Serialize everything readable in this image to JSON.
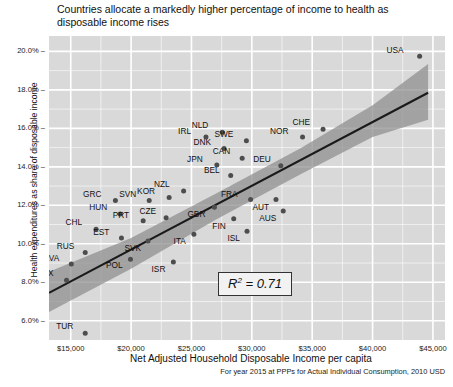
{
  "chart_data": {
    "type": "scatter",
    "title": "Countries allocate a markedly higher percentage of income to health as disposable income rises",
    "xlabel": "Net Adjusted Household Disposable Income per capita",
    "ylabel": "Health expenditures as share of disposable income",
    "note": "For year 2015 at PPPs for Actual Individual Consumption, 2010 USD",
    "annotation": "R² = 0.71",
    "annotation_r": "R",
    "annotation_sup": "2",
    "annotation_rest": " = 0.71",
    "xlim": [
      13200,
      46000
    ],
    "ylim": [
      5.0,
      20.8
    ],
    "xticks": [
      15000,
      20000,
      25000,
      30000,
      35000,
      40000,
      45000
    ],
    "xticklabels": [
      "$15,000",
      "$20,000",
      "$25,000",
      "$30,000",
      "$35,000",
      "$40,000",
      "$45,000"
    ],
    "yticks": [
      6,
      8,
      10,
      12,
      14,
      16,
      18,
      20
    ],
    "yticklabels": [
      "6.0%",
      "8.0%",
      "10.0%",
      "12.0%",
      "14.0%",
      "16.0%",
      "18.0%",
      "20.0%"
    ],
    "grid": true,
    "legend": "none",
    "panel_color": "#d9d9d9",
    "grid_color": "#ffffff",
    "point_color": "#4d4d4d",
    "trend_color": "#1a1a1a",
    "band_color": "#8c8c8c",
    "trendline": {
      "x1": 13200,
      "y1": 7.45,
      "x2": 44600,
      "y2": 17.85
    },
    "confidence_band": {
      "upper": [
        [
          13200,
          8.55
        ],
        [
          20000,
          10.3
        ],
        [
          27000,
          12.6
        ],
        [
          34000,
          14.95
        ],
        [
          40000,
          17.2
        ],
        [
          44600,
          19.35
        ]
      ],
      "lower": [
        [
          13200,
          6.45
        ],
        [
          20000,
          8.7
        ],
        [
          27000,
          11.25
        ],
        [
          34000,
          13.6
        ],
        [
          40000,
          15.55
        ],
        [
          44600,
          16.45
        ]
      ]
    },
    "points": [
      {
        "label": "MEX",
        "x": 14650,
        "y": 8.1,
        "lx": -13,
        "ly": -4
      },
      {
        "label": "TUR",
        "x": 16200,
        "y": 5.35,
        "lx": -12,
        "ly": -4
      },
      {
        "label": "LVA",
        "x": 15050,
        "y": 8.95,
        "lx": -12,
        "ly": -3
      },
      {
        "label": "RUS",
        "x": 16200,
        "y": 9.55,
        "lx": -11,
        "ly": -4
      },
      {
        "label": "CHL",
        "x": 17100,
        "y": 10.75,
        "lx": -14,
        "ly": -4
      },
      {
        "label": "EST",
        "x": 19200,
        "y": 10.3,
        "lx": -12,
        "ly": -3
      },
      {
        "label": "POL",
        "x": 19950,
        "y": 9.2,
        "lx": -8,
        "ly": 9
      },
      {
        "label": "HUN",
        "x": 19100,
        "y": 11.55,
        "lx": -13,
        "ly": -4
      },
      {
        "label": "GRC",
        "x": 18700,
        "y": 12.25,
        "lx": -14,
        "ly": -4
      },
      {
        "label": "SVK",
        "x": 21400,
        "y": 10.15,
        "lx": -7,
        "ly": 10
      },
      {
        "label": "SVN",
        "x": 21500,
        "y": 12.25,
        "lx": -13,
        "ly": -4
      },
      {
        "label": "PRT",
        "x": 21000,
        "y": 11.2,
        "lx": -14,
        "ly": -3
      },
      {
        "label": "CZE",
        "x": 22900,
        "y": 11.35,
        "lx": -10,
        "ly": -4
      },
      {
        "label": "KOR",
        "x": 23150,
        "y": 12.4,
        "lx": -14,
        "ly": -4
      },
      {
        "label": "ISR",
        "x": 23500,
        "y": 9.05,
        "lx": -8,
        "ly": 10
      },
      {
        "label": "NZL",
        "x": 24350,
        "y": 12.75,
        "lx": -14,
        "ly": -4
      },
      {
        "label": "ITA",
        "x": 25200,
        "y": 10.5,
        "lx": -8,
        "ly": 10
      },
      {
        "label": "IRL",
        "x": 26200,
        "y": 15.55,
        "lx": -15,
        "ly": -3
      },
      {
        "label": "NLD",
        "x": 27550,
        "y": 15.8,
        "lx": -14,
        "ly": -4
      },
      {
        "label": "DNK",
        "x": 27700,
        "y": 14.95,
        "lx": -13,
        "ly": -4
      },
      {
        "label": "JPN",
        "x": 27100,
        "y": 14.1,
        "lx": -14,
        "ly": -3
      },
      {
        "label": "GBR",
        "x": 26900,
        "y": 11.9,
        "lx": -9,
        "ly": 10
      },
      {
        "label": "BEL",
        "x": 28250,
        "y": 13.55,
        "lx": -11,
        "ly": -3
      },
      {
        "label": "SWE",
        "x": 29550,
        "y": 15.35,
        "lx": -13,
        "ly": -4
      },
      {
        "label": "CAN",
        "x": 29200,
        "y": 14.45,
        "lx": -12,
        "ly": -4
      },
      {
        "label": "FIN",
        "x": 28500,
        "y": 11.3,
        "lx": -8,
        "ly": 10
      },
      {
        "label": "ISL",
        "x": 29600,
        "y": 10.65,
        "lx": -7,
        "ly": 10
      },
      {
        "label": "FRA",
        "x": 29900,
        "y": 12.3,
        "lx": -13,
        "ly": -3
      },
      {
        "label": "AUT",
        "x": 32000,
        "y": 12.3,
        "lx": -7,
        "ly": 10
      },
      {
        "label": "AUS",
        "x": 32600,
        "y": 11.7,
        "lx": -7,
        "ly": 10
      },
      {
        "label": "DEU",
        "x": 32400,
        "y": 14.05,
        "lx": -10,
        "ly": -4
      },
      {
        "label": "NOR",
        "x": 34200,
        "y": 15.55,
        "lx": -14,
        "ly": -3
      },
      {
        "label": "CHE",
        "x": 35900,
        "y": 15.95,
        "lx": -13,
        "ly": -4
      },
      {
        "label": "USA",
        "x": 43900,
        "y": 19.75,
        "lx": -16,
        "ly": -3
      }
    ]
  }
}
